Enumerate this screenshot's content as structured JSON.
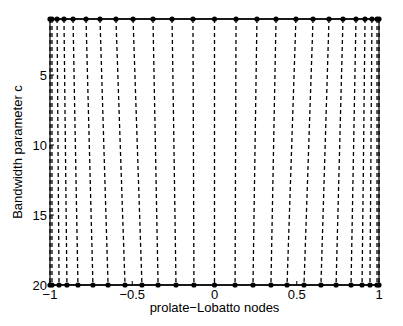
{
  "chart_data": {
    "type": "line",
    "title": "",
    "xlabel": "prolate−Lobatto nodes",
    "ylabel": "Bandwidth parameter c",
    "xlim": [
      -1,
      1
    ],
    "ylim": [
      1,
      20
    ],
    "y_reversed": true,
    "grid": false,
    "legend": null,
    "xticks": [
      -1,
      -0.5,
      0,
      0.5,
      1
    ],
    "xtick_labels": [
      "−1",
      "−0.5",
      "0",
      "0.5",
      "1"
    ],
    "yticks": [
      5,
      10,
      15,
      20
    ],
    "ytick_labels": [
      "5",
      "10",
      "15",
      "20"
    ],
    "num_nodes": 25,
    "series": [
      {
        "name": "nodes at c=1",
        "c": 1,
        "style": "solid line with dot markers",
        "values": [
          -1,
          -0.988,
          -0.957,
          -0.915,
          -0.86,
          -0.781,
          -0.696,
          -0.599,
          -0.495,
          -0.374,
          -0.258,
          -0.131,
          0,
          0.131,
          0.258,
          0.374,
          0.495,
          0.599,
          0.696,
          0.781,
          0.86,
          0.915,
          0.957,
          0.988,
          1
        ]
      },
      {
        "name": "nodes at c=20",
        "c": 20,
        "style": "solid line with dot markers",
        "values": [
          -1,
          -0.988,
          -0.945,
          -0.897,
          -0.83,
          -0.739,
          -0.647,
          -0.544,
          -0.441,
          -0.343,
          -0.234,
          -0.125,
          0,
          0.125,
          0.234,
          0.343,
          0.441,
          0.544,
          0.647,
          0.739,
          0.83,
          0.897,
          0.945,
          0.988,
          1
        ]
      }
    ],
    "trajectory_style": "dashed black lines connecting each node from c=1 to c=20",
    "colors": {
      "lines": "#000000",
      "background": "#ffffff"
    }
  }
}
